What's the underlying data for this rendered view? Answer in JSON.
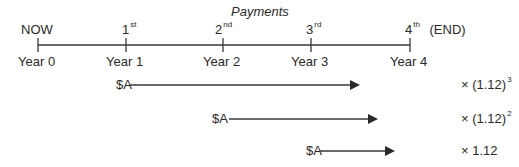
{
  "title": "Payments",
  "timeline": {
    "points": [
      {
        "top": "NOW",
        "top_sup": "",
        "top_extra": "",
        "bottom": "Year 0",
        "x": 38
      },
      {
        "top": "1",
        "top_sup": "st",
        "top_extra": "",
        "bottom": "Year 1",
        "x": 126
      },
      {
        "top": "2",
        "top_sup": "nd",
        "top_extra": "",
        "bottom": "Year 2",
        "x": 223
      },
      {
        "top": "3",
        "top_sup": "rd",
        "top_extra": "",
        "bottom": "Year 3",
        "x": 311
      },
      {
        "top": "4",
        "top_sup": "th",
        "top_extra": "(END)",
        "bottom": "Year 4",
        "x": 410
      }
    ]
  },
  "flows": [
    {
      "label": "$A",
      "multiplier": "× (1.12)",
      "exponent": "3"
    },
    {
      "label": "$A",
      "multiplier": "× (1.12)",
      "exponent": "2"
    },
    {
      "label": "$A",
      "multiplier": "× 1.12",
      "exponent": ""
    }
  ],
  "colors": {
    "line": "#3a3a3a",
    "text": "#2a2a2a"
  }
}
